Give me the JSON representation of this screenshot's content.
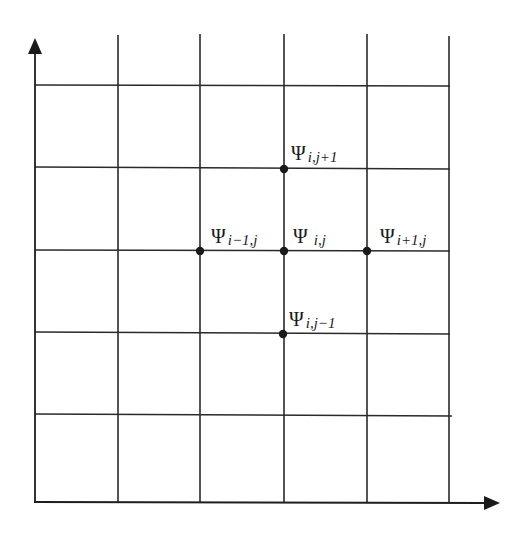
{
  "diagram": {
    "type": "finite-difference-grid",
    "axes": {
      "x_axis": {
        "arrow": "right",
        "label": ""
      },
      "y_axis": {
        "arrow": "up",
        "label": ""
      }
    },
    "grid": {
      "vertical_lines_x": [
        118,
        200,
        284,
        367,
        449
      ],
      "horizontal_lines_y": [
        85,
        168,
        251,
        333,
        415
      ],
      "columns": 5,
      "rows": 5
    },
    "nodes": [
      {
        "id": "center",
        "symbol": "Ψ",
        "subscript": "i,j",
        "x": 284,
        "y": 251
      },
      {
        "id": "north",
        "symbol": "Ψ",
        "subscript": "i,j+1",
        "x": 284,
        "y": 168
      },
      {
        "id": "south",
        "symbol": "Ψ",
        "subscript": "i,j−1",
        "x": 284,
        "y": 333
      },
      {
        "id": "west",
        "symbol": "Ψ",
        "subscript": "i−1,j",
        "x": 200,
        "y": 251
      },
      {
        "id": "east",
        "symbol": "Ψ",
        "subscript": "i+1,j",
        "x": 367,
        "y": 251
      }
    ],
    "colors": {
      "line": "#2a2a2a",
      "node": "#1a1a1a",
      "background": "#ffffff"
    }
  }
}
